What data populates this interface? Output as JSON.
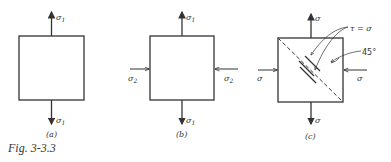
{
  "figure": {
    "caption": "Fig. 3-3.3",
    "panels": [
      {
        "id": "a",
        "label": "(a)",
        "top_stress": "σ",
        "top_sub": "1",
        "bottom_stress": "σ",
        "bottom_sub": "1"
      },
      {
        "id": "b",
        "label": "(b)",
        "top_stress": "σ",
        "top_sub": "1",
        "bottom_stress": "σ",
        "bottom_sub": "1",
        "left_stress": "σ",
        "left_sub": "2",
        "right_stress": "σ",
        "right_sub": "2"
      },
      {
        "id": "c",
        "label": "(c)",
        "top_stress": "σ",
        "bottom_stress": "σ",
        "left_stress": "σ",
        "right_stress": "σ",
        "shear_annotation": "τ = σ",
        "angle_annotation": "45°"
      }
    ]
  },
  "colors": {
    "line": "#333333",
    "background": "#ffffff"
  }
}
